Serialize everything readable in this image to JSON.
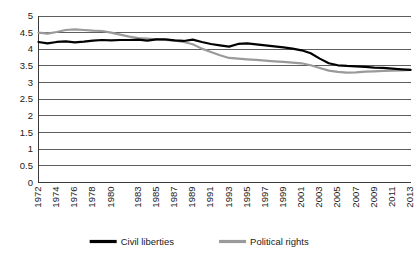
{
  "chart_data": {
    "type": "line",
    "title": "",
    "subtitle": "",
    "xlabel": "",
    "ylabel": "",
    "ylim": [
      0,
      5
    ],
    "xlim": [
      1972,
      2013
    ],
    "grid": "horizontal",
    "legend_position": "bottom-center",
    "y_ticks": [
      "0",
      "0.5",
      "1",
      "1.5",
      "2",
      "2.5",
      "3",
      "3.5",
      "4",
      "4.5",
      "5"
    ],
    "y_tick_values": [
      0,
      0.5,
      1,
      1.5,
      2,
      2.5,
      3,
      3.5,
      4,
      4.5,
      5
    ],
    "x_tick_labels": [
      "1972",
      "1974",
      "1976",
      "1978",
      "1980",
      "1983",
      "1985",
      "1987",
      "1989",
      "1991",
      "1993",
      "1995",
      "1997",
      "1999",
      "2001",
      "2003",
      "2005",
      "2007",
      "2009",
      "2011",
      "2013"
    ],
    "x": [
      1972,
      1973,
      1974,
      1975,
      1976,
      1977,
      1978,
      1979,
      1980,
      1981,
      1982,
      1983,
      1984,
      1985,
      1986,
      1987,
      1988,
      1989,
      1990,
      1991,
      1992,
      1993,
      1994,
      1995,
      1996,
      1997,
      1998,
      1999,
      2000,
      2001,
      2002,
      2003,
      2004,
      2005,
      2006,
      2007,
      2008,
      2009,
      2010,
      2011,
      2012,
      2013
    ],
    "series": [
      {
        "name": "Civil liberties",
        "color": "#000000",
        "values": [
          4.22,
          4.18,
          4.22,
          4.24,
          4.21,
          4.23,
          4.26,
          4.28,
          4.27,
          4.28,
          4.28,
          4.29,
          4.26,
          4.3,
          4.3,
          4.27,
          4.25,
          4.29,
          4.22,
          4.16,
          4.12,
          4.08,
          4.16,
          4.18,
          4.15,
          4.12,
          4.09,
          4.06,
          4.02,
          3.97,
          3.88,
          3.72,
          3.58,
          3.52,
          3.5,
          3.49,
          3.47,
          3.45,
          3.44,
          3.42,
          3.4,
          3.38
        ],
        "marker": "none",
        "linewidth": 2.2
      },
      {
        "name": "Political rights",
        "color": "#9a9a9a",
        "values": [
          4.5,
          4.47,
          4.52,
          4.58,
          4.6,
          4.58,
          4.56,
          4.55,
          4.5,
          4.44,
          4.38,
          4.34,
          4.32,
          4.3,
          4.28,
          4.26,
          4.22,
          4.15,
          4.02,
          3.92,
          3.82,
          3.74,
          3.72,
          3.7,
          3.68,
          3.66,
          3.64,
          3.62,
          3.6,
          3.58,
          3.52,
          3.44,
          3.36,
          3.32,
          3.3,
          3.31,
          3.33,
          3.34,
          3.35,
          3.36,
          3.37,
          3.38
        ],
        "marker": "none",
        "linewidth": 2.2
      }
    ],
    "legend": [
      {
        "label": "Civil liberties",
        "color": "#000000"
      },
      {
        "label": "Political rights",
        "color": "#9a9a9a"
      }
    ]
  }
}
